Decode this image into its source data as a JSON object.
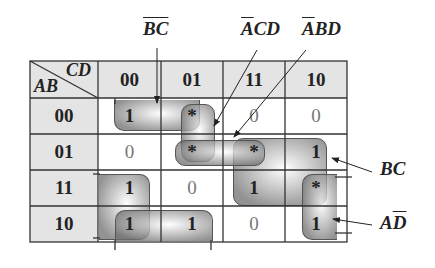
{
  "kmap": {
    "corner": {
      "row_var": "AB",
      "col_var": "CD"
    },
    "col_headers": [
      "00",
      "01",
      "11",
      "10"
    ],
    "row_headers": [
      "00",
      "01",
      "11",
      "10"
    ],
    "cells": [
      [
        "1",
        "*",
        "0",
        "0"
      ],
      [
        "0",
        "*",
        "*",
        "1"
      ],
      [
        "1",
        "0",
        "1",
        "*"
      ],
      [
        "1",
        "1",
        "0",
        "1"
      ]
    ]
  },
  "labels": {
    "bc_bar": "BC",
    "acd_a": "A",
    "acd_rest": "CD",
    "abd_a": "A",
    "abd_rest": "BD",
    "bc": "BC",
    "ad_a": "A",
    "ad_d": "D"
  },
  "colors": {
    "header_bg": "#e4e4e4",
    "grid_line": "#333333",
    "group_fill": "#8a8a8a"
  }
}
